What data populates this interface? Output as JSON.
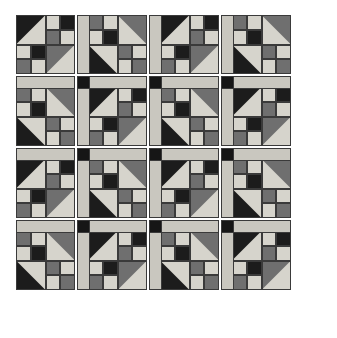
{
  "artwork": {
    "title": "Patchwork Quilt Block Sampler",
    "type": "quilt-layout",
    "canvas_width": 337,
    "canvas_height": 338,
    "background_color": "#ffffff"
  },
  "palette": {
    "dark": "#1c1c1c",
    "light": "#d6d4cc",
    "medium": "#6f6f6f",
    "sashing": "#c9c7bf",
    "cornerstone": "#161616",
    "outline": "#3a3a3a",
    "background": "#ffffff"
  },
  "layout": {
    "rows": 4,
    "columns": 4,
    "block_size": 59,
    "sash_thickness": 13,
    "margin_left": 16,
    "margin_top": 15,
    "block_pitch": 72,
    "cornerstone_size": 13,
    "grid_unit": 4
  },
  "block_origins_x": [
    16,
    88,
    160,
    232
  ],
  "block_origins_y": [
    15,
    87,
    159,
    231
  ],
  "sash_origins_x": [
    77,
    149,
    221
  ],
  "sash_origins_y": [
    76,
    148,
    220
  ],
  "block_variants": {
    "A": {
      "name": "shoofly-chevron-left",
      "description": "Large half-square triangle in top-left corner with dark upper wedge, second large half-square triangle in bottom-right with medium lower wedge, checkerboard of dark and light squares through the center diagonal",
      "patches": [
        {
          "kind": "hst",
          "col": 0,
          "row": 0,
          "w": 2,
          "h": 2,
          "corner": "tl",
          "fill_a": "dark",
          "fill_b": "light"
        },
        {
          "kind": "square",
          "col": 2,
          "row": 0,
          "w": 1,
          "h": 1,
          "fill": "light"
        },
        {
          "kind": "square",
          "col": 3,
          "row": 0,
          "w": 1,
          "h": 1,
          "fill": "dark"
        },
        {
          "kind": "square",
          "col": 2,
          "row": 1,
          "w": 1,
          "h": 1,
          "fill": "medium"
        },
        {
          "kind": "square",
          "col": 3,
          "row": 1,
          "w": 1,
          "h": 1,
          "fill": "light"
        },
        {
          "kind": "square",
          "col": 0,
          "row": 2,
          "w": 1,
          "h": 1,
          "fill": "light"
        },
        {
          "kind": "square",
          "col": 1,
          "row": 2,
          "w": 1,
          "h": 1,
          "fill": "dark"
        },
        {
          "kind": "square",
          "col": 0,
          "row": 3,
          "w": 1,
          "h": 1,
          "fill": "medium"
        },
        {
          "kind": "square",
          "col": 1,
          "row": 3,
          "w": 1,
          "h": 1,
          "fill": "light"
        },
        {
          "kind": "hst",
          "col": 2,
          "row": 2,
          "w": 2,
          "h": 2,
          "corner": "br",
          "fill_a": "light",
          "fill_b": "medium"
        }
      ]
    },
    "B": {
      "name": "shoofly-chevron-right",
      "description": "Large half-square triangle in top-right corner with medium upper wedge, second large half-square triangle in bottom-left with dark lower wedge, checkerboard of dark and light squares through the center counter-diagonal",
      "patches": [
        {
          "kind": "square",
          "col": 0,
          "row": 0,
          "w": 1,
          "h": 1,
          "fill": "medium"
        },
        {
          "kind": "square",
          "col": 1,
          "row": 0,
          "w": 1,
          "h": 1,
          "fill": "light"
        },
        {
          "kind": "square",
          "col": 0,
          "row": 1,
          "w": 1,
          "h": 1,
          "fill": "light"
        },
        {
          "kind": "square",
          "col": 1,
          "row": 1,
          "w": 1,
          "h": 1,
          "fill": "dark"
        },
        {
          "kind": "hst",
          "col": 2,
          "row": 0,
          "w": 2,
          "h": 2,
          "corner": "tr",
          "fill_a": "medium",
          "fill_b": "light"
        },
        {
          "kind": "hst",
          "col": 0,
          "row": 2,
          "w": 2,
          "h": 2,
          "corner": "bl",
          "fill_a": "dark",
          "fill_b": "light"
        },
        {
          "kind": "square",
          "col": 2,
          "row": 2,
          "w": 1,
          "h": 1,
          "fill": "medium"
        },
        {
          "kind": "square",
          "col": 3,
          "row": 2,
          "w": 1,
          "h": 1,
          "fill": "light"
        },
        {
          "kind": "square",
          "col": 2,
          "row": 3,
          "w": 1,
          "h": 1,
          "fill": "light"
        },
        {
          "kind": "square",
          "col": 3,
          "row": 3,
          "w": 1,
          "h": 1,
          "fill": "medium"
        }
      ]
    }
  },
  "block_matrix": [
    [
      "A",
      "B",
      "A",
      "B"
    ],
    [
      "B",
      "A",
      "B",
      "A"
    ],
    [
      "A",
      "B",
      "A",
      "B"
    ],
    [
      "B",
      "A",
      "B",
      "A"
    ]
  ],
  "sashing": {
    "vertical_label": "vertical sashing strip",
    "horizontal_label": "horizontal sashing strip",
    "cornerstone_label": "cornerstone square",
    "vertical_count": 12,
    "horizontal_count": 12,
    "cornerstone_count": 9
  }
}
